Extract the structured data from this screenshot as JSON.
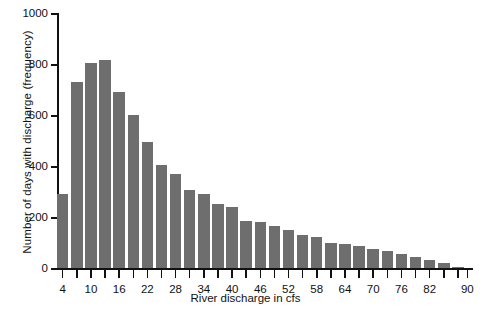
{
  "chart_data": {
    "type": "bar",
    "title": "",
    "subtitle": "",
    "xlabel": "River discharge in cfs",
    "ylabel": "Number of days with discharge (frequency)",
    "xlim": [
      3,
      91
    ],
    "ylim": [
      0,
      1000
    ],
    "grid": false,
    "legend": null,
    "bar_color": "#6e6e6e",
    "axis_color": "#111111",
    "bin_width": 3,
    "y_ticks": [
      0,
      200,
      400,
      600,
      800,
      1000
    ],
    "y_tick_labels": [
      "0",
      "200",
      "400",
      "600",
      "800",
      "1000"
    ],
    "x_tick_values": [
      4,
      7,
      10,
      13,
      16,
      19,
      22,
      25,
      28,
      31,
      34,
      37,
      40,
      43,
      46,
      49,
      52,
      55,
      58,
      61,
      64,
      67,
      70,
      73,
      76,
      79,
      82,
      85,
      88,
      90
    ],
    "x_tick_labels": [
      "4",
      "10",
      "16",
      "22",
      "28",
      "34",
      "40",
      "46",
      "52",
      "58",
      "64",
      "70",
      "76",
      "82",
      "90"
    ],
    "x_tick_label_values": [
      4,
      10,
      16,
      22,
      28,
      34,
      40,
      46,
      52,
      58,
      64,
      70,
      76,
      82,
      90
    ],
    "categories": [
      4,
      7,
      10,
      13,
      16,
      19,
      22,
      25,
      28,
      31,
      34,
      37,
      40,
      43,
      46,
      49,
      52,
      55,
      58,
      61,
      64,
      67,
      70,
      73,
      76,
      79,
      82,
      85,
      88
    ],
    "values": [
      290,
      730,
      805,
      815,
      690,
      600,
      495,
      405,
      370,
      305,
      290,
      250,
      240,
      185,
      180,
      165,
      150,
      130,
      120,
      100,
      95,
      85,
      75,
      65,
      55,
      45,
      30,
      20,
      5
    ]
  }
}
